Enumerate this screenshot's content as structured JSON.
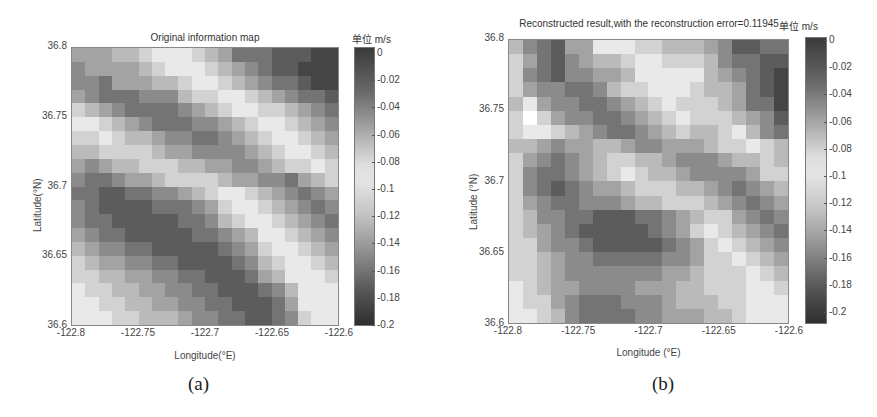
{
  "panels": [
    {
      "id": "a",
      "title": "Original information map",
      "unit_label": "单位 m/s",
      "xlabel": "Longitude(°E)",
      "ylabel": "Latitude(°N)",
      "caption": "(a)",
      "xticks": [
        "-122.8",
        "-122.75",
        "-122.7",
        "-122.65",
        "-122.6"
      ],
      "yticks": [
        "36.8",
        "36.75",
        "36.7",
        "36.65",
        "36.6"
      ],
      "cticks": [
        "0",
        "-0.02",
        "-0.04",
        "-0.06",
        "-0.08",
        "-0.1",
        "-0.12",
        "-0.14",
        "-0.16",
        "-0.18",
        "-0.2"
      ]
    },
    {
      "id": "b",
      "title": "Reconstructed result,with the reconstruction error=0.11945",
      "unit_label": "单位 m/s",
      "xlabel": "Longitude (°E)",
      "ylabel": "Latitude (°N)",
      "caption": "(b)",
      "xticks": [
        "-122.8",
        "-122.75",
        "-122.7",
        "-122.65",
        "-122.6"
      ],
      "yticks": [
        "36.8",
        "36.75",
        "36.7",
        "36.65",
        "36.6"
      ],
      "cticks": [
        "0",
        "-0.02",
        "-0.04",
        "-0.06",
        "-0.08",
        "-0.1",
        "-0.12",
        "-0.14",
        "-0.16",
        "-0.18",
        "-0.2"
      ]
    }
  ],
  "chart_data": [
    {
      "type": "heatmap",
      "title": "Original information map",
      "xlabel": "Longitude(°E)",
      "ylabel": "Latitude(°N)",
      "colorbar_label": "单位 m/s",
      "xlim": [
        -122.8,
        -122.6
      ],
      "ylim": [
        36.6,
        36.8
      ],
      "clim": [
        -0.2,
        0
      ],
      "colormap": "grey diverging: dark at 0 and -0.2, light near -0.09",
      "grid_size": [
        20,
        20
      ],
      "shade_rows_top_to_bottom": [
        "55566788876533322211",
        "45555678887654322111",
        "44355566788765433211",
        "54333444677887654332",
        "76543333456788776543",
        "88765433344567887654",
        "77876654433456788765",
        "66777765544445678876",
        "54566777665544567787",
        "43345567777655443567",
        "33223344567887654345",
        "43222233345788765434",
        "43322222334678876543",
        "54332222233456887654",
        "65443322222345788765",
        "76554433222234678876",
        "77665544332223568887",
        "87766554433222346888",
        "88776655443322235888",
        "88877666544332234788"
      ]
    },
    {
      "type": "heatmap",
      "title": "Reconstructed result,with the reconstruction error=0.11945",
      "xlabel": "Longitude (°E)",
      "ylabel": "Latitude (°N)",
      "colorbar_label": "单位 m/s",
      "xlim": [
        -122.8,
        -122.6
      ],
      "ylim": [
        36.6,
        36.8
      ],
      "clim": [
        -0.21,
        0
      ],
      "reconstruction_error": 0.11945,
      "colormap": "grey diverging: dark at 0 and -0.2, light near -0.09",
      "grid_size": [
        20,
        20
      ],
      "shade_rows_top_to_bottom": [
        "64325588877666542233",
        "75324566788777643322",
        "74324455688888654321",
        "75443346778887665321",
        "68544334567877765331",
        "79754433456787776542",
        "78876543345676678643",
        "66545566544555677876",
        "75434567766544456676",
        "74334567876654444577",
        "74323455677766543456",
        "75433444566777654345",
        "76443322233456775434",
        "76543222223457876543",
        "77544322222345787654",
        "77654433333445778765",
        "77654444444556777876",
        "87655444455566777887",
        "87754333444566677888",
        "88764333344555667888"
      ]
    }
  ]
}
